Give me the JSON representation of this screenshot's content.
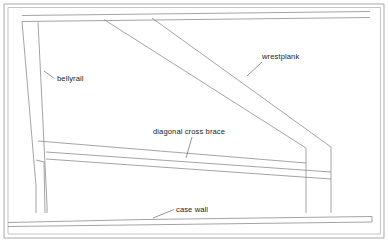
{
  "diagram": {
    "background_color": "#ffffff",
    "line_color": "#8d8d8d",
    "frame_color": "#a8a8a8",
    "text_color": "#1b1b1b",
    "width": 388,
    "height": 242
  },
  "labels": [
    {
      "id": "bellyrail",
      "text": "bellyrail",
      "x": 57,
      "y": 81,
      "anchor": "start",
      "leader": "M 54.5 78.5 L 44 71"
    },
    {
      "id": "wrestplank",
      "text": "wrestplank",
      "x": 262,
      "y": 59,
      "anchor": "start",
      "leader": "M 262 62 L 247 76"
    },
    {
      "id": "diagonal-cross-brace",
      "text": "diagonal cross brace",
      "x": 153,
      "y": 134,
      "anchor": "start",
      "leader": "M 192 137 L 186 158"
    },
    {
      "id": "case-wall",
      "text": "case wall",
      "x": 176,
      "y": 212,
      "anchor": "start",
      "leader": "M 174 209.5 L 153 218"
    }
  ],
  "structure": {
    "outer_frame": "M 4 4 L 384 4 L 384 238 L 4 238 Z",
    "inner_frame": "M 8 7.5 L 380.5 7.5 L 380.5 234 L 8 234 Z",
    "top_rail_upper": "M 22 15.5 L 370 11.5",
    "top_rail_lower": "M 22 21.5 L 370 17.5",
    "left_post_outer": "M 22 21 L 36 186 L 36 213",
    "left_post_inner": "M 38 21.5 L 47 205 L 47 213",
    "left_post_notch": "M 36 160 L 44 162",
    "left_post_front": "M 44 162 L 45 213",
    "wrestplank_upper": "M 104 19.5 L 306 148",
    "wrestplank_lower": "M 152 18 L 331 147",
    "right_post_left": "M 306 148 L 306 213",
    "right_post_right": "M 331 147 L 331 213",
    "brace_top_edge": "M 38 141 L 306 163",
    "brace_mid_edge": "M 46 152 L 331 172",
    "brace_bottom_edge": "M 46 159 L 331 179",
    "base_top_left": "M 8 222.5 L 145 219.5",
    "base_top_right": "M 145 219.5 L 372 216.5",
    "base_bottom": "M 8 226.5 L 372 222",
    "base_right_end": "M 372 216.5 L 372 222"
  }
}
